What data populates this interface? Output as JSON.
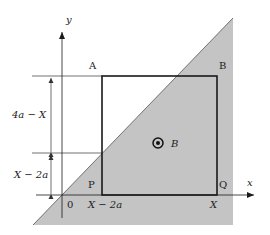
{
  "diagram": {
    "colors": {
      "background": "#ffffff",
      "field_region": "#c4c4c4",
      "lines": "#1a1a1a",
      "thin_lines": "#333333"
    },
    "axes": {
      "x_label": "x",
      "y_label": "y",
      "origin_label": "0"
    },
    "square": {
      "corner_A": "A",
      "corner_B": "B",
      "corner_P": "P",
      "corner_Q": "Q"
    },
    "field": {
      "symbol": "⊙",
      "label": "B",
      "direction": "out of page"
    },
    "dimensions": {
      "upper_segment": "4a − X",
      "lower_segment": "X − 2a"
    },
    "x_ticks": {
      "left_edge": "X − 2a",
      "right_edge": "X"
    }
  }
}
